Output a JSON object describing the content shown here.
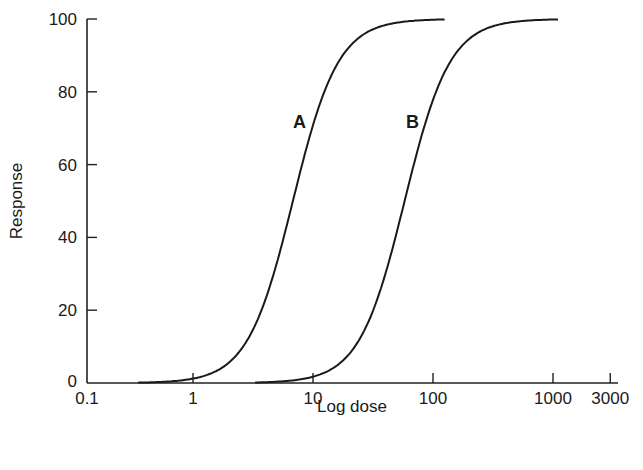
{
  "chart_data": {
    "type": "line",
    "title": "",
    "xlabel": "Log dose",
    "ylabel": "Response",
    "x_scale": "log",
    "xlim": [
      0.1,
      3000
    ],
    "ylim": [
      0,
      100
    ],
    "x_ticks": [
      "0.1",
      "1",
      "10",
      "100",
      "1000",
      "3000"
    ],
    "y_ticks": [
      "0",
      "20",
      "40",
      "60",
      "80",
      "100"
    ],
    "grid": false,
    "legend": "none (curves labeled inline)",
    "series": [
      {
        "name": "A",
        "ed50": 6.8,
        "x": [
          0.5,
          1,
          2,
          3,
          5,
          6.8,
          10,
          15,
          20,
          30,
          50,
          100,
          120
        ],
        "y": [
          0,
          1,
          8,
          18,
          37,
          50,
          68,
          83,
          90,
          96,
          99,
          100,
          100
        ]
      },
      {
        "name": "B",
        "ed50": 58,
        "x": [
          5,
          10,
          20,
          30,
          50,
          58,
          100,
          150,
          200,
          300,
          500,
          1000,
          1100
        ],
        "y": [
          0,
          1,
          9,
          19,
          42,
          50,
          72,
          85,
          91,
          96,
          99,
          100,
          100
        ]
      }
    ],
    "annotations": [
      {
        "text": "A",
        "x": 8,
        "y": 72
      },
      {
        "text": "B",
        "x": 65,
        "y": 72
      }
    ]
  }
}
